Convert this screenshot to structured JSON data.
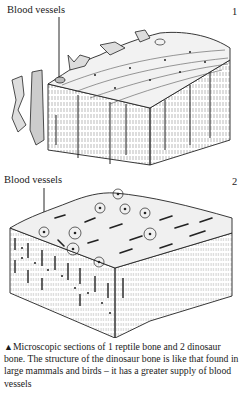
{
  "figure1": {
    "label": "Blood vessels",
    "number": "1",
    "subject": "reptile bone section"
  },
  "figure2": {
    "label": "Blood vessels",
    "number": "2",
    "subject": "dinosaur bone section"
  },
  "caption": {
    "marker": "▲",
    "text": "Microscopic sections of 1 reptile bone and 2 dinosaur bone. The structure of the dinosaur bone is like that found in large mammals and birds – it has a greater supply of blood vessels"
  }
}
